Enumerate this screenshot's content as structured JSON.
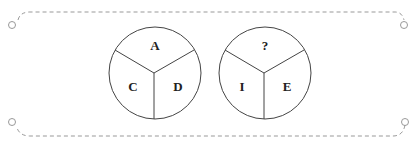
{
  "puzzle": {
    "circles": [
      {
        "top": "A",
        "left": "C",
        "right": "D"
      },
      {
        "top": "?",
        "left": "I",
        "right": "E"
      }
    ]
  },
  "colors": {
    "stroke": "#444444",
    "dash": "#888888",
    "text": "#222222"
  }
}
